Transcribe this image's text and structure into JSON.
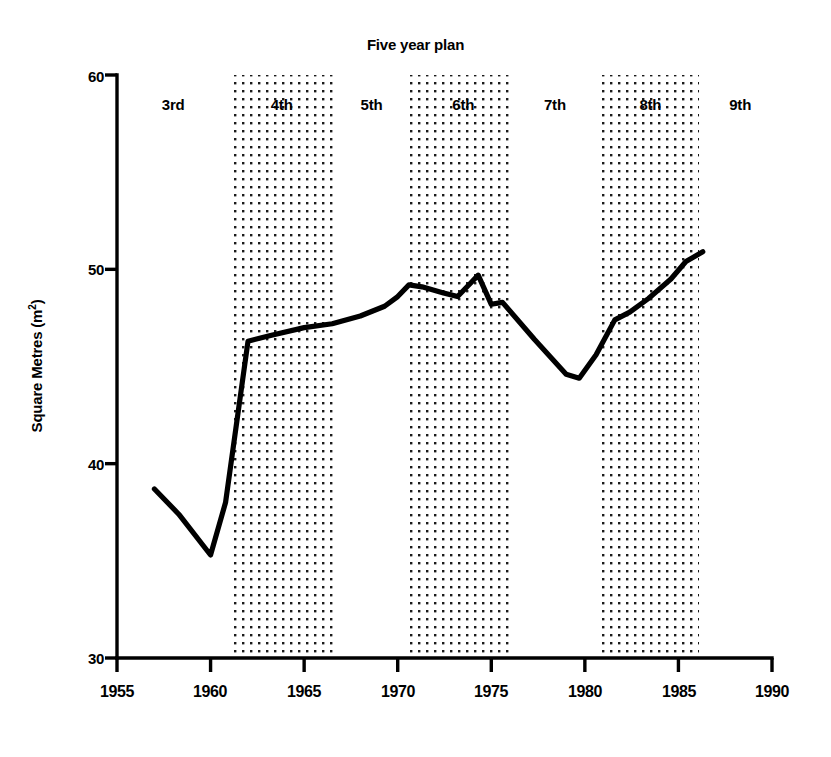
{
  "chart_data": {
    "type": "line",
    "title": "Five year plan",
    "xlabel": "",
    "ylabel": "Square Metres (m²)",
    "xlim": [
      1955,
      1990
    ],
    "ylim": [
      30,
      60
    ],
    "x_ticks": [
      1955,
      1960,
      1965,
      1970,
      1975,
      1980,
      1985,
      1990
    ],
    "x_tick_labels": [
      "1955",
      "1960",
      "1965",
      "1970",
      "1975",
      "1980",
      "1985",
      "1990"
    ],
    "y_ticks": [
      30,
      40,
      50,
      60
    ],
    "y_tick_labels": [
      "30",
      "40",
      "50",
      "60"
    ],
    "grid": false,
    "legend": "none",
    "series": [
      {
        "name": "Square Metres per dwelling",
        "x": [
          1957.0,
          1958.3,
          1960.0,
          1960.8,
          1962.0,
          1963.2,
          1965.0,
          1966.5,
          1968.0,
          1969.3,
          1970.0,
          1970.6,
          1971.3,
          1972.4,
          1973.2,
          1973.9,
          1974.3,
          1975.0,
          1975.6,
          1977.3,
          1979.0,
          1979.7,
          1980.6,
          1981.6,
          1982.4,
          1983.4,
          1984.6,
          1985.4,
          1986.3
        ],
        "values": [
          38.7,
          37.4,
          35.3,
          38.0,
          46.3,
          46.6,
          47.0,
          47.2,
          47.6,
          48.1,
          48.6,
          49.2,
          49.1,
          48.8,
          48.6,
          49.3,
          49.7,
          48.2,
          48.3,
          46.4,
          44.6,
          44.4,
          45.6,
          47.4,
          47.8,
          48.5,
          49.5,
          50.4,
          50.9
        ]
      }
    ],
    "shaded_bands": [
      {
        "label": "4th",
        "start": 1961.0,
        "end": 1966.6
      },
      {
        "label": "6th",
        "start": 1970.6,
        "end": 1976.2
      },
      {
        "label": "8th",
        "start": 1980.8,
        "end": 1986.1
      }
    ],
    "plan_labels": [
      {
        "label": "3rd",
        "x": 1963.0,
        "shaded": false,
        "center": 1958.0
      },
      {
        "label": "4th",
        "x": 1963.8,
        "shaded": true,
        "center": 1963.8
      },
      {
        "label": "5th",
        "x": 1968.6,
        "shaded": false,
        "center": 1968.6
      },
      {
        "label": "6th",
        "x": 1973.5,
        "shaded": true,
        "center": 1973.5
      },
      {
        "label": "7th",
        "x": 1978.4,
        "shaded": false,
        "center": 1978.4
      },
      {
        "label": "8th",
        "x": 1983.5,
        "shaded": true,
        "center": 1983.5
      },
      {
        "label": "9th",
        "x": 1988.3,
        "shaded": false,
        "center": 1988.3
      }
    ]
  },
  "plan_labels_text": {
    "p3": "3rd",
    "p4": "4th",
    "p5": "5th",
    "p6": "6th",
    "p7": "7th",
    "p8": "8th",
    "p9": "9th"
  },
  "axis": {
    "y_title_main": "Square Metres (m",
    "y_title_sup": "2",
    "y_title_close": ")",
    "y0": "30",
    "y1": "40",
    "y2": "50",
    "y3": "60",
    "x0": "1955",
    "x1": "1960",
    "x2": "1965",
    "x3": "1970",
    "x4": "1975",
    "x5": "1980",
    "x6": "1985",
    "x7": "1990"
  },
  "colors": {
    "line": "#000000",
    "axis": "#000000",
    "band_dots": "#1a1a1a",
    "background": "#ffffff"
  }
}
